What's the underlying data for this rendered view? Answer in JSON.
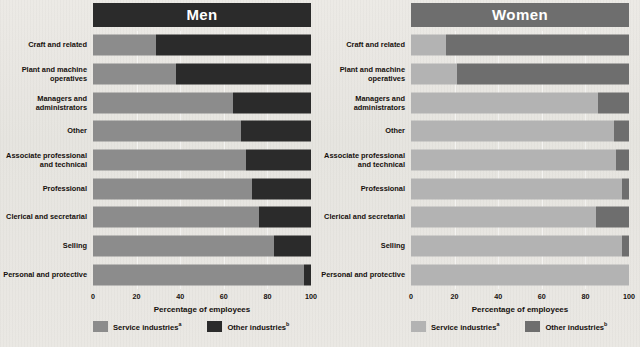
{
  "figure": {
    "background_color": "#e8e6e1",
    "axis_title": "Percentage of employees",
    "tick_labels": [
      "0",
      "20",
      "40",
      "60",
      "80",
      "100"
    ],
    "tick_values": [
      0,
      20,
      40,
      60,
      80,
      100
    ],
    "legend": {
      "service_label": "Service industries",
      "service_sup": "a",
      "other_label": "Other industries",
      "other_sup": "b",
      "service_color_men": "#8c8c8c",
      "other_color_men": "#2b2b2b",
      "service_color_women": "#b3b3b3",
      "other_color_women": "#6e6e6e"
    },
    "panels": [
      {
        "title": "Men",
        "title_bg": "#2b2b2b",
        "service_color": "#8c8c8c",
        "other_color": "#2b2b2b"
      },
      {
        "title": "Women",
        "title_bg": "#6e6e6e",
        "service_color": "#b3b3b3",
        "other_color": "#6e6e6e"
      }
    ]
  },
  "chart_data": {
    "type": "bar",
    "orientation": "horizontal",
    "stacked": true,
    "title": "",
    "xlabel": "Percentage of employees",
    "ylabel": "",
    "xlim": [
      0,
      100
    ],
    "grid": true,
    "legend_position": "bottom",
    "legend_entries": [
      "Service industriesᵃ",
      "Other industriesᵇ"
    ],
    "categories": [
      "Craft and related",
      "Plant and machine operatives",
      "Managers and administrators",
      "Other",
      "Associate professional and technical",
      "Professional",
      "Clerical and secretarial",
      "Selling",
      "Personal and protective"
    ],
    "panels": [
      {
        "name": "Men",
        "series": [
          {
            "name": "Service industries",
            "values": [
              29,
              38,
              64,
              68,
              70,
              73,
              76,
              83,
              97
            ]
          },
          {
            "name": "Other industries",
            "values": [
              71,
              62,
              36,
              32,
              30,
              27,
              24,
              17,
              3
            ]
          }
        ]
      },
      {
        "name": "Women",
        "series": [
          {
            "name": "Service industries",
            "values": [
              16,
              21,
              86,
              93,
              94,
              97,
              85,
              97,
              100
            ]
          },
          {
            "name": "Other industries",
            "values": [
              84,
              79,
              14,
              7,
              6,
              3,
              15,
              3,
              0
            ]
          }
        ]
      }
    ]
  },
  "rows": [
    {
      "label": "Craft and related"
    },
    {
      "label": "Plant and machine\noperatives"
    },
    {
      "label": "Managers and\nadministrators"
    },
    {
      "label": "Other"
    },
    {
      "label": "Associate professional\nand technical"
    },
    {
      "label": "Professional"
    },
    {
      "label": "Clerical and secretarial"
    },
    {
      "label": "Selling"
    },
    {
      "label": "Personal and protective"
    }
  ]
}
